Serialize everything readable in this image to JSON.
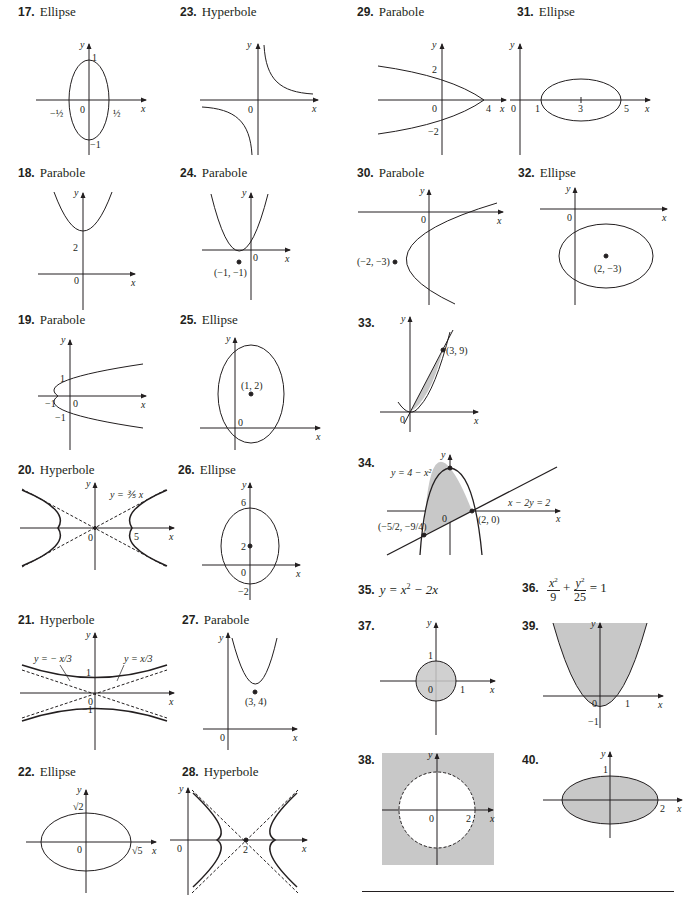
{
  "problems": [
    {
      "num": "17.",
      "label": "Ellipse"
    },
    {
      "num": "18.",
      "label": "Parabole"
    },
    {
      "num": "19.",
      "label": "Parabole"
    },
    {
      "num": "20.",
      "label": "Hyperbole"
    },
    {
      "num": "21.",
      "label": "Hyperbole"
    },
    {
      "num": "22.",
      "label": "Ellipse"
    },
    {
      "num": "23.",
      "label": "Hyperbole"
    },
    {
      "num": "24.",
      "label": "Parabole"
    },
    {
      "num": "25.",
      "label": "Ellipse"
    },
    {
      "num": "26.",
      "label": "Ellipse"
    },
    {
      "num": "27.",
      "label": "Parabole"
    },
    {
      "num": "28.",
      "label": "Hyperbole"
    },
    {
      "num": "29.",
      "label": "Parabole"
    },
    {
      "num": "30.",
      "label": "Parabole"
    },
    {
      "num": "31.",
      "label": "Ellipse"
    },
    {
      "num": "32.",
      "label": "Ellipse"
    },
    {
      "num": "33.",
      "label": ""
    },
    {
      "num": "34.",
      "label": ""
    },
    {
      "num": "35.",
      "label": ""
    },
    {
      "num": "36.",
      "label": ""
    },
    {
      "num": "37.",
      "label": ""
    },
    {
      "num": "38.",
      "label": ""
    },
    {
      "num": "39.",
      "label": ""
    },
    {
      "num": "40.",
      "label": ""
    }
  ],
  "equations": {
    "p35": {
      "lhs": "y = x",
      "exp": "2",
      "rhs": " − 2x"
    },
    "p36": {
      "n1": "x",
      "e1": "2",
      "d1": "9",
      "plus": "+",
      "n2": "y",
      "e2": "2",
      "d2": "25",
      "eq": "= 1"
    }
  },
  "axis_labels": {
    "x": "x",
    "y": "y"
  },
  "ticks": {
    "p17": {
      "one": "1",
      "neg_one": "−1",
      "zero": "0",
      "neg_half": "−½",
      "half": "½"
    },
    "p18": {
      "two": "2",
      "zero": "0"
    },
    "p19": {
      "one": "1",
      "neg_one": "−1",
      "neg_one_x": "−1",
      "zero": "0"
    },
    "p20": {
      "zero": "0",
      "five": "5",
      "asymptote": "y = ⅗ x"
    },
    "p21": {
      "one": "1",
      "neg_one": "−1",
      "zero": "0",
      "asym_neg": "y = − x/3",
      "asym_pos": "y = x/3"
    },
    "p22": {
      "sqrt2": "√2",
      "sqrt5": "√5",
      "zero": "0"
    },
    "p23": {
      "zero": "0"
    },
    "p24": {
      "zero": "0",
      "vertex": "(−1, −1)"
    },
    "p25": {
      "zero": "0",
      "center": "(1, 2)"
    },
    "p26": {
      "six": "6",
      "two": "2",
      "zero": "0",
      "neg_two": "−2"
    },
    "p27": {
      "zero": "0",
      "vertex": "(3, 4)"
    },
    "p28": {
      "zero": "0",
      "two": "2"
    },
    "p29": {
      "two": "2",
      "neg_two": "−2",
      "zero": "0",
      "four": "4"
    },
    "p30": {
      "zero": "0",
      "vertex": "(−2, −3)"
    },
    "p31": {
      "zero": "0",
      "one": "1",
      "three": "3",
      "five": "5"
    },
    "p32": {
      "zero": "0",
      "center": "(2, −3)"
    },
    "p33": {
      "zero": "0",
      "point": "(3, 9)"
    },
    "p34": {
      "zero": "0",
      "curve": "y = 4 − x²",
      "line": "x − 2y = 2",
      "pt1": "(2, 0)",
      "pt2": "(−5/2, −9/4)"
    },
    "p37": {
      "one_y": "1",
      "one_x": "1",
      "zero": "0"
    },
    "p38": {
      "zero": "0",
      "two": "2"
    },
    "p39": {
      "zero": "0",
      "one": "1",
      "neg_one": "−1"
    },
    "p40": {
      "one": "1",
      "two": "2"
    }
  },
  "colors": {
    "ink": "#231f20",
    "shade": "#c8c8c8"
  }
}
